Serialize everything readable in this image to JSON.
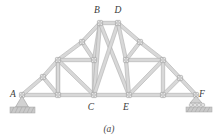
{
  "figure": {
    "caption": "(a)",
    "type": "truss-diagram",
    "colors": {
      "member_fill": "#d8d8d8",
      "member_stroke": "#a8a8a8",
      "pin_stroke": "#8c8c8c",
      "pin_fill": "#ffffff",
      "label_color": "#3a3a3a",
      "ground_fill": "#c9c9c9",
      "ground_stroke": "#9a9a9a",
      "background": "#ffffff"
    },
    "joint_labels": [
      {
        "id": "A",
        "text": "A",
        "x": 13,
        "y": 97
      },
      {
        "id": "B",
        "text": "B",
        "x": 97,
        "y": 13
      },
      {
        "id": "C",
        "text": "C",
        "x": 91,
        "y": 110
      },
      {
        "id": "D",
        "text": "D",
        "x": 118,
        "y": 13
      },
      {
        "id": "E",
        "text": "E",
        "x": 126,
        "y": 110
      },
      {
        "id": "F",
        "text": "F",
        "x": 202,
        "y": 97
      }
    ],
    "joints": [
      {
        "id": "A",
        "x": 22,
        "y": 95
      },
      {
        "id": "A1",
        "x": 58,
        "y": 95
      },
      {
        "id": "C",
        "x": 94,
        "y": 95
      },
      {
        "id": "E",
        "x": 129,
        "y": 95
      },
      {
        "id": "F1",
        "x": 163,
        "y": 95
      },
      {
        "id": "F",
        "x": 196,
        "y": 95
      },
      {
        "id": "L1",
        "x": 43,
        "y": 77
      },
      {
        "id": "L2",
        "x": 58,
        "y": 60
      },
      {
        "id": "L3",
        "x": 82,
        "y": 42
      },
      {
        "id": "B",
        "x": 100,
        "y": 23
      },
      {
        "id": "M1",
        "x": 94,
        "y": 60
      },
      {
        "id": "D",
        "x": 118,
        "y": 23
      },
      {
        "id": "R3",
        "x": 140,
        "y": 42
      },
      {
        "id": "M2",
        "x": 126,
        "y": 60
      },
      {
        "id": "R2",
        "x": 163,
        "y": 60
      },
      {
        "id": "R1",
        "x": 180,
        "y": 78
      }
    ],
    "members": [
      {
        "from": "A",
        "to": "A1",
        "kind": "bottom-chord"
      },
      {
        "from": "A1",
        "to": "C",
        "kind": "bottom-chord"
      },
      {
        "from": "C",
        "to": "E",
        "kind": "bottom-chord"
      },
      {
        "from": "E",
        "to": "F1",
        "kind": "bottom-chord"
      },
      {
        "from": "F1",
        "to": "F",
        "kind": "bottom-chord"
      },
      {
        "from": "A",
        "to": "L1",
        "kind": "top-chord"
      },
      {
        "from": "L1",
        "to": "L2",
        "kind": "top-chord"
      },
      {
        "from": "L2",
        "to": "L3",
        "kind": "top-chord"
      },
      {
        "from": "L3",
        "to": "B",
        "kind": "top-chord"
      },
      {
        "from": "B",
        "to": "D",
        "kind": "ridge-chord"
      },
      {
        "from": "D",
        "to": "R3",
        "kind": "top-chord"
      },
      {
        "from": "R3",
        "to": "R2",
        "kind": "top-chord"
      },
      {
        "from": "R2",
        "to": "R1",
        "kind": "top-chord"
      },
      {
        "from": "R1",
        "to": "F",
        "kind": "top-chord"
      },
      {
        "from": "L1",
        "to": "A1",
        "kind": "web-diagonal"
      },
      {
        "from": "L2",
        "to": "A1",
        "kind": "web-vertical"
      },
      {
        "from": "L2",
        "to": "M1",
        "kind": "web-horizontal"
      },
      {
        "from": "L2",
        "to": "C",
        "kind": "web-diagonal"
      },
      {
        "from": "A1",
        "to": "L2",
        "kind": "web-vertical"
      },
      {
        "from": "L3",
        "to": "M1",
        "kind": "web-vertical"
      },
      {
        "from": "M1",
        "to": "C",
        "kind": "web-vertical"
      },
      {
        "from": "B",
        "to": "M1",
        "kind": "web-vertical"
      },
      {
        "from": "B",
        "to": "C",
        "kind": "web-vertical"
      },
      {
        "from": "B",
        "to": "E",
        "kind": "web-diagonal"
      },
      {
        "from": "D",
        "to": "C",
        "kind": "web-diagonal"
      },
      {
        "from": "D",
        "to": "M2",
        "kind": "web-vertical"
      },
      {
        "from": "M2",
        "to": "E",
        "kind": "web-vertical"
      },
      {
        "from": "M2",
        "to": "R2",
        "kind": "web-horizontal"
      },
      {
        "from": "R3",
        "to": "M2",
        "kind": "web-vertical"
      },
      {
        "from": "R2",
        "to": "E",
        "kind": "web-diagonal"
      },
      {
        "from": "R2",
        "to": "F1",
        "kind": "web-vertical"
      },
      {
        "from": "R1",
        "to": "F1",
        "kind": "web-diagonal"
      }
    ],
    "supports": [
      {
        "id": "support-A",
        "type": "pin",
        "x": 22,
        "y": 95
      },
      {
        "id": "support-F",
        "type": "roller",
        "x": 196,
        "y": 95
      }
    ]
  }
}
